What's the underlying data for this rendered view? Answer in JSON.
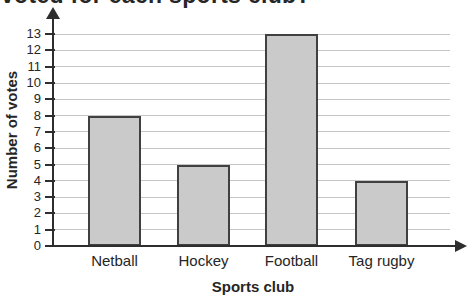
{
  "chart_data": {
    "type": "bar",
    "title": "voted for each sports club?",
    "categories": [
      "Netball",
      "Hockey",
      "Football",
      "Tag rugby"
    ],
    "values": [
      8,
      5,
      13,
      4
    ],
    "xlabel": "Sports club",
    "ylabel": "Number of votes",
    "ylim": [
      0,
      13
    ],
    "ytick_step": 1,
    "grid": true,
    "legend": false,
    "colors": {
      "bar_fill": "#cacaca",
      "bar_border": "#404040",
      "gridline": "#c6c6c6",
      "axis": "#2e2e2e",
      "text": "#262626"
    }
  }
}
